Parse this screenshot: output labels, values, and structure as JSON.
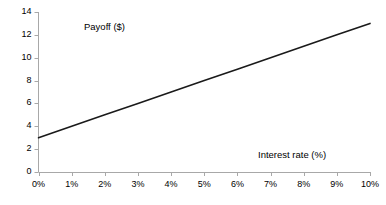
{
  "chart_data": {
    "type": "line",
    "title": "",
    "xlabel": "Interest rate (%)",
    "ylabel": "Payoff ($)",
    "xlim": [
      0,
      10
    ],
    "ylim": [
      0,
      14
    ],
    "grid": false,
    "legend": "none",
    "x_tick_labels": [
      "0%",
      "1%",
      "2%",
      "3%",
      "4%",
      "5%",
      "6%",
      "7%",
      "8%",
      "9%",
      "10%"
    ],
    "x_tick_values": [
      0,
      1,
      2,
      3,
      4,
      5,
      6,
      7,
      8,
      9,
      10
    ],
    "y_tick_labels": [
      "0",
      "2",
      "4",
      "6",
      "8",
      "10",
      "12",
      "14"
    ],
    "y_tick_values": [
      0,
      2,
      4,
      6,
      8,
      10,
      12,
      14
    ],
    "series": [
      {
        "name": "Payoff",
        "color": "#1a1a1a",
        "x": [
          0,
          1,
          2,
          3,
          4,
          5,
          6,
          7,
          8,
          9,
          10
        ],
        "values": [
          3,
          4,
          5,
          6,
          7,
          8,
          9,
          10,
          11,
          12,
          13
        ]
      }
    ],
    "annotations": {
      "y_axis_caption": "Payoff ($)",
      "x_axis_caption": "Interest rate (%)"
    },
    "colors": {
      "line": "#1a1a1a",
      "axis": "#a8a8a8",
      "text": "#000000",
      "background": "#ffffff"
    }
  }
}
